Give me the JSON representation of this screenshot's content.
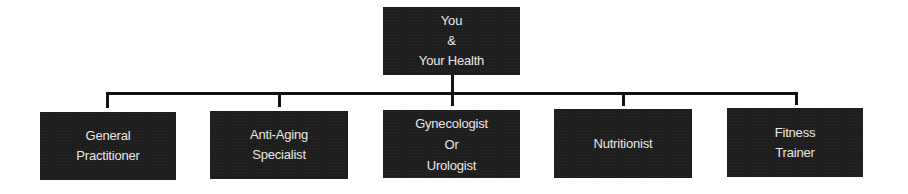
{
  "root": {
    "lines": [
      "You",
      "&",
      "Your Health"
    ]
  },
  "children": [
    {
      "lines": [
        "General",
        "Practitioner"
      ]
    },
    {
      "lines": [
        "Anti-Aging",
        "Specialist"
      ]
    },
    {
      "lines": [
        "Gynecologist",
        "Or",
        "Urologist"
      ]
    },
    {
      "lines": [
        "Nutritionist"
      ]
    },
    {
      "lines": [
        "Fitness",
        "Trainer"
      ]
    }
  ],
  "colors": {
    "box_fill": "#1e1e1e",
    "box_text": "#e8e8e8",
    "connector": "#111111",
    "background": "#ffffff"
  }
}
